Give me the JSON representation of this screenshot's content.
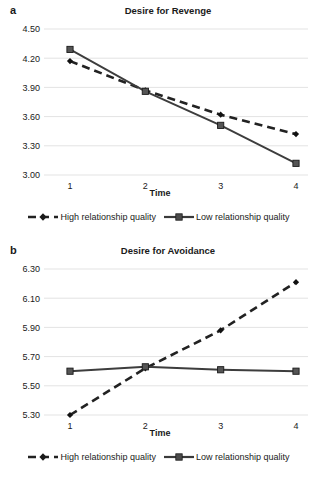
{
  "figure": {
    "width": 318,
    "height": 481,
    "background": "#ffffff",
    "line_color": "#333333",
    "grid_color": "#e3e3e3",
    "text_color": "#1a1a1a"
  },
  "panels": [
    {
      "letter": "a",
      "title": "Desire for Revenge",
      "xlabel": "Time",
      "legend": [
        {
          "label": "High relationship quality",
          "marker": "diamond-marker",
          "style": "dashed"
        },
        {
          "label": "Low relationship quality",
          "marker": "square-marker",
          "style": "solid"
        }
      ],
      "yticks": [
        "4.50",
        "4.20",
        "3.90",
        "3.60",
        "3.30",
        "3.00"
      ],
      "xticks": [
        "1",
        "2",
        "3",
        "4"
      ]
    },
    {
      "letter": "b",
      "title": "Desire for Avoidance",
      "xlabel": "Time",
      "legend": [
        {
          "label": "High relationship quality",
          "marker": "diamond-marker",
          "style": "dashed"
        },
        {
          "label": "Low relationship quality",
          "marker": "square-marker",
          "style": "solid"
        }
      ],
      "yticks": [
        "6.30",
        "6.10",
        "5.90",
        "5.70",
        "5.50",
        "5.30"
      ],
      "xticks": [
        "1",
        "2",
        "3",
        "4"
      ]
    }
  ],
  "chart_data": [
    {
      "type": "line",
      "title": "Desire for Revenge",
      "panel": "a",
      "xlabel": "Time",
      "ylabel": "",
      "x": [
        1,
        2,
        3,
        4
      ],
      "categories": [
        "1",
        "2",
        "3",
        "4"
      ],
      "xtick_labels": [
        "1",
        "2",
        "3",
        "4"
      ],
      "ytick_labels": [
        "3.00",
        "3.30",
        "3.60",
        "3.90",
        "4.20",
        "4.50"
      ],
      "ylim": [
        3.0,
        4.5
      ],
      "ytick_step": 0.3,
      "grid": true,
      "legend_position": "bottom",
      "series": [
        {
          "name": "High relationship quality",
          "style": "dashed",
          "marker": "diamond",
          "values": [
            4.17,
            3.87,
            3.62,
            3.42
          ]
        },
        {
          "name": "Low relationship quality",
          "style": "solid",
          "marker": "square",
          "values": [
            4.29,
            3.86,
            3.51,
            3.12
          ]
        }
      ]
    },
    {
      "type": "line",
      "title": "Desire for Avoidance",
      "panel": "b",
      "xlabel": "Time",
      "ylabel": "",
      "x": [
        1,
        2,
        3,
        4
      ],
      "categories": [
        "1",
        "2",
        "3",
        "4"
      ],
      "xtick_labels": [
        "1",
        "2",
        "3",
        "4"
      ],
      "ytick_labels": [
        "5.30",
        "5.50",
        "5.70",
        "5.90",
        "6.10",
        "6.30"
      ],
      "ylim": [
        5.3,
        6.3
      ],
      "ytick_step": 0.2,
      "grid": true,
      "legend_position": "bottom",
      "series": [
        {
          "name": "High relationship quality",
          "style": "dashed",
          "marker": "diamond",
          "values": [
            5.3,
            5.62,
            5.88,
            6.21
          ]
        },
        {
          "name": "Low relationship quality",
          "style": "solid",
          "marker": "square",
          "values": [
            5.6,
            5.63,
            5.61,
            5.6
          ]
        }
      ]
    }
  ]
}
